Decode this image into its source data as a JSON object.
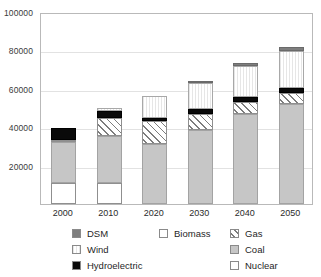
{
  "chart_data": {
    "type": "bar",
    "subtype": "stacked-vertical",
    "title": "",
    "xlabel": "",
    "ylabel": "",
    "categories": [
      "2000",
      "2010",
      "2020",
      "2030",
      "2040",
      "2050"
    ],
    "ylim": [
      0,
      100000
    ],
    "ytick_values": [
      20000,
      40000,
      60000,
      80000,
      100000
    ],
    "ytick_labels": [
      "20000",
      "40000",
      "60000",
      "80000",
      "100000"
    ],
    "grid": true,
    "grid_axis": "y",
    "legend_position": "below",
    "legend_columns": 3,
    "series": [
      {
        "name": "Nuclear",
        "swatch": "white-outline",
        "color": "#ffffff",
        "values": [
          11000,
          11000,
          0,
          0,
          0,
          0
        ]
      },
      {
        "name": "Coal",
        "swatch": "solid-gray",
        "color": "#c6c6c6",
        "values": [
          21500,
          24500,
          31000,
          38500,
          47000,
          52000
        ]
      },
      {
        "name": "Biomass",
        "swatch": "white-outline",
        "color": "#ffffff",
        "values": [
          800,
          0,
          0,
          0,
          0,
          0
        ]
      },
      {
        "name": "Gas",
        "swatch": "diagonal-hatch",
        "color": "#ffffff",
        "values": [
          0,
          9500,
          12000,
          8500,
          6000,
          6000
        ]
      },
      {
        "name": "Hydroelectric",
        "swatch": "solid-black",
        "color": "#0a0a0a",
        "values": [
          6200,
          3500,
          2000,
          2500,
          2500,
          2500
        ]
      },
      {
        "name": "Wind",
        "swatch": "light-vertical-stripe",
        "color": "#ececec",
        "values": [
          0,
          1500,
          11500,
          13500,
          16500,
          19000
        ]
      },
      {
        "name": "DSM",
        "swatch": "solid-dark-gray",
        "color": "#7e7e7e",
        "values": [
          0,
          0,
          0,
          1000,
          1500,
          2500
        ]
      }
    ],
    "stack_order_bottom_to_top": [
      "Nuclear",
      "Coal",
      "Biomass",
      "Gas",
      "Hydroelectric",
      "Wind",
      "DSM"
    ],
    "totals": [
      39500,
      50000,
      56500,
      64000,
      73500,
      82000
    ]
  },
  "legend": {
    "columns": [
      {
        "items": [
          {
            "label": "DSM",
            "swatch": "solid-dark-gray"
          },
          {
            "label": "Wind",
            "swatch": "light-vertical-stripe"
          },
          {
            "label": "Hydroelectric",
            "swatch": "solid-black"
          }
        ]
      },
      {
        "items": [
          {
            "label": "Biomass",
            "swatch": "white-outline"
          }
        ]
      },
      {
        "items": [
          {
            "label": "Gas",
            "swatch": "diagonal-hatch"
          },
          {
            "label": "Coal",
            "swatch": "solid-gray"
          },
          {
            "label": "Nuclear",
            "swatch": "white-outline"
          }
        ]
      }
    ]
  },
  "colors": {
    "dsm": "#7e7e7e",
    "wind": "#ececec",
    "hydroelectric": "#0a0a0a",
    "biomass": "#ffffff",
    "gas": "#ffffff",
    "coal": "#c6c6c6",
    "nuclear": "#ffffff",
    "gridline": "#e2e2e2",
    "axis": "#b9b9b9"
  }
}
